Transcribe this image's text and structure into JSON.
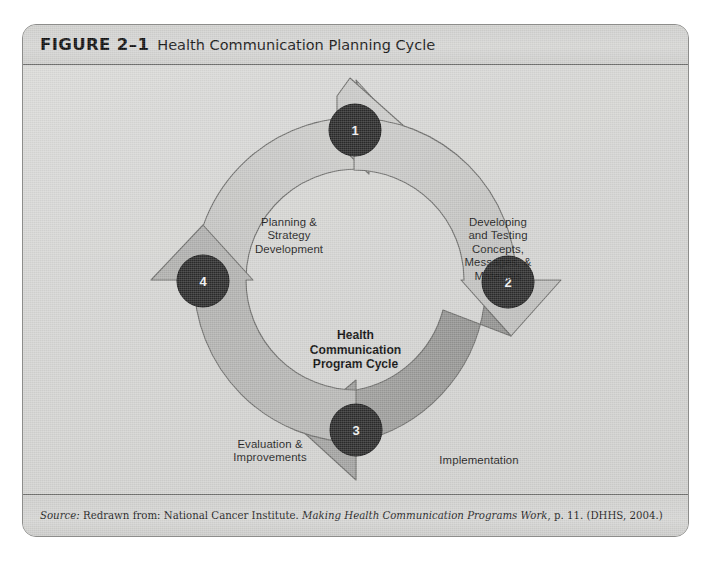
{
  "figure": {
    "number": "FIGURE 2–1",
    "title": "Health Communication Planning Cycle",
    "source_prefix": "Source:",
    "source_text_1": " Redrawn from: National Cancer Institute. ",
    "source_italic": "Making Health Communication Programs Work",
    "source_text_2": ", p. 11. (DHHS, 2004.)"
  },
  "diagram": {
    "type": "cycle",
    "center_label": "Health\nCommunication\nProgram Cycle",
    "steps": [
      {
        "number": "1",
        "label": "Planning &\nStrategy\nDevelopment",
        "segment_color": "#c9c9c7",
        "position": "top-left"
      },
      {
        "number": "2",
        "label": "Developing\nand Testing\nConcepts,\nMessages, &\nMaterials",
        "segment_color": "#c2c2c0",
        "position": "top-right"
      },
      {
        "number": "3",
        "label": "Implementation",
        "segment_color": "#9a9a98",
        "position": "bottom-right"
      },
      {
        "number": "4",
        "label": "Evaluation &\nImprovements",
        "segment_color": "#b4b4b2",
        "position": "bottom-left"
      }
    ],
    "badge_color": "#2b2b2b",
    "badge_text_color": "#f2f2f2",
    "frame_color": "#d3d3d1",
    "stroke_color": "#6d6d6b"
  }
}
